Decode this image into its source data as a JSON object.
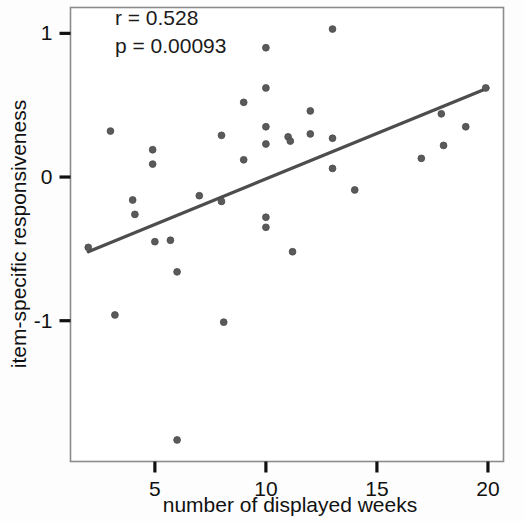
{
  "chart_data": {
    "type": "scatter",
    "title": "",
    "xlabel": "number of displayed weeks",
    "ylabel": "item-specific responsiveness",
    "xlim": [
      1.2,
      20.7
    ],
    "ylim": [
      -1.98,
      1.18
    ],
    "xticks": [
      5,
      10,
      15,
      20
    ],
    "xtick_labels": [
      "5",
      "10",
      "15",
      "20"
    ],
    "yticks": [
      1,
      0,
      -1
    ],
    "ytick_labels": [
      "1",
      "0",
      "-1"
    ],
    "grid": false,
    "legend": null,
    "marker_color": "#5a5a5a",
    "marker_size": 6,
    "line_color": "#4d4d4d",
    "frame_color": "#8c8c8c",
    "annotations": [
      {
        "name": "correlation-coefficient",
        "text": "r = 0.528",
        "x": 3.2,
        "y": 1.06
      },
      {
        "name": "p-value",
        "text": "p = 0.00093",
        "x": 3.2,
        "y": 0.86
      }
    ],
    "points": [
      {
        "x": 2.0,
        "y": -0.49
      },
      {
        "x": 3.0,
        "y": 0.32
      },
      {
        "x": 3.2,
        "y": -0.96
      },
      {
        "x": 4.0,
        "y": -0.16
      },
      {
        "x": 4.1,
        "y": -0.26
      },
      {
        "x": 4.9,
        "y": 0.19
      },
      {
        "x": 4.9,
        "y": 0.09
      },
      {
        "x": 5.0,
        "y": -0.45
      },
      {
        "x": 5.7,
        "y": -0.44
      },
      {
        "x": 6.0,
        "y": -0.66
      },
      {
        "x": 6.0,
        "y": -1.83
      },
      {
        "x": 7.0,
        "y": -0.13
      },
      {
        "x": 8.0,
        "y": 0.29
      },
      {
        "x": 8.0,
        "y": -0.17
      },
      {
        "x": 8.1,
        "y": -1.01
      },
      {
        "x": 9.0,
        "y": 0.52
      },
      {
        "x": 9.0,
        "y": 0.12
      },
      {
        "x": 10.0,
        "y": 0.9
      },
      {
        "x": 10.0,
        "y": 0.62
      },
      {
        "x": 10.0,
        "y": 0.35
      },
      {
        "x": 10.0,
        "y": 0.23
      },
      {
        "x": 10.0,
        "y": -0.28
      },
      {
        "x": 10.0,
        "y": -0.35
      },
      {
        "x": 11.0,
        "y": 0.28
      },
      {
        "x": 11.1,
        "y": 0.25
      },
      {
        "x": 11.2,
        "y": -0.52
      },
      {
        "x": 12.0,
        "y": 0.46
      },
      {
        "x": 12.0,
        "y": 0.3
      },
      {
        "x": 13.0,
        "y": 1.03
      },
      {
        "x": 13.0,
        "y": 0.27
      },
      {
        "x": 13.0,
        "y": 0.06
      },
      {
        "x": 14.0,
        "y": -0.09
      },
      {
        "x": 17.0,
        "y": 0.13
      },
      {
        "x": 17.9,
        "y": 0.44
      },
      {
        "x": 18.0,
        "y": 0.22
      },
      {
        "x": 19.0,
        "y": 0.35
      },
      {
        "x": 19.9,
        "y": 0.62
      }
    ],
    "fit_line": {
      "name": "regression-line",
      "x_start": 2.0,
      "y_start": -0.52,
      "x_end": 20.0,
      "y_end": 0.62
    }
  }
}
